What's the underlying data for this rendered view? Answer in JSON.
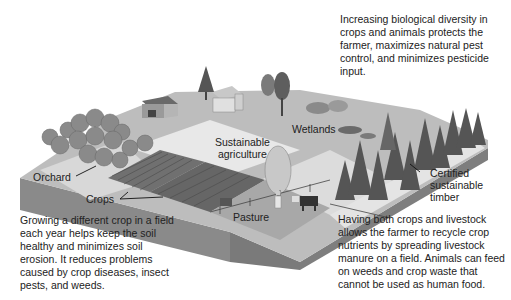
{
  "colors": {
    "background": "#ffffff",
    "ground_top": "#bdbdbd",
    "ground_side": "#8c8c8c",
    "ground_side_dark": "#7a7a7a",
    "field_light": "#e6e6e6",
    "crops": "#6e6e6e",
    "trees": "#5a5a5a",
    "text": "#222222"
  },
  "labels": {
    "orchard": "Orchard",
    "crops": "Crops",
    "sustainable_agriculture": [
      "Sustainable",
      "agriculture"
    ],
    "wetlands": "Wetlands",
    "pasture": "Pasture",
    "certified_timber": [
      "Certified",
      "sustainable",
      "timber"
    ]
  },
  "callouts": {
    "biodiversity": "Increasing biological diversity in crops and animals protects the farmer, maximizes natural pest control, and minimizes pesticide input.",
    "crop_rotation": "Growing a different crop in a field each year helps keep the soil healthy and minimizes soil erosion. It reduces problems caused by crop diseases, insect pests, and weeds.",
    "livestock": "Having both crops and livestock allows the farmer to recycle crop nutrients by spreading livestock manure on a field. Animals can feed on weeds and crop waste that cannot be used as human food."
  }
}
